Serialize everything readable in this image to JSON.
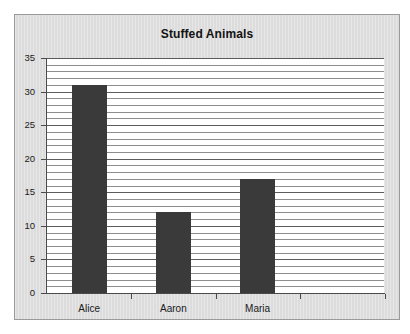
{
  "chart_data": {
    "type": "bar",
    "title": "Stuffed Animals",
    "xlabel": "",
    "ylabel": "",
    "categories": [
      "Alice",
      "Aaron",
      "Maria",
      ""
    ],
    "values": [
      31,
      12,
      17,
      null
    ],
    "ylim": [
      0,
      35
    ],
    "y_ticks": [
      0,
      5,
      10,
      15,
      20,
      25,
      30,
      35
    ],
    "y_tick_labels": [
      "0",
      "5",
      "10",
      "15",
      "20",
      "25",
      "30",
      "35"
    ],
    "minor_tick_step": 1,
    "major_tick_step": 5,
    "grid": true,
    "legend": false,
    "bar_color": "#3a3a3a",
    "plot_background": "#ffffff",
    "frame_background": "#dcdcdc",
    "axis_color": "#4a4a4a",
    "gridline_color": "#8d8d8d",
    "major_gridline_color": "#5c5c5c",
    "title_color": "#121212",
    "label_color": "#1a1a1a"
  }
}
